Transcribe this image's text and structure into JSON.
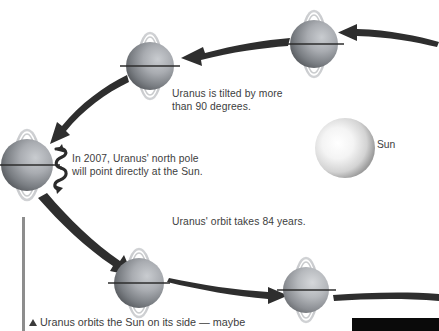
{
  "figure": {
    "title": "Uranus orbits the Sun on its side",
    "background_color": "#ffffff",
    "text_color": "#3d3d3d"
  },
  "captions": {
    "tilt": "Uranus is tilted by more\nthan 90 degrees.",
    "north_pole": "In 2007, Uranus' north pole\nwill point directly at the Sun.",
    "orbit_period": "Uranus' orbit takes 84 years.",
    "bottom": "Uranus orbits the Sun on its side — maybe"
  },
  "labels": {
    "sun": "Sun"
  },
  "bodies": {
    "sun": {
      "name": "Sun",
      "cx": 345,
      "cy": 148,
      "r": 30,
      "color": "#f2f2f2",
      "shade": "#9a9a9a"
    },
    "planets": [
      {
        "name": "uranus-top-right",
        "cx": 314,
        "cy": 44,
        "r": 24,
        "ring_tilt": 0
      },
      {
        "name": "uranus-top-left",
        "cx": 150,
        "cy": 66,
        "r": 24,
        "ring_tilt": 0
      },
      {
        "name": "uranus-left",
        "cx": 27,
        "cy": 165,
        "r": 26,
        "ring_tilt": 0
      },
      {
        "name": "uranus-bottom-left",
        "cx": 139,
        "cy": 283,
        "r": 25,
        "ring_tilt": 0
      },
      {
        "name": "uranus-bottom-right",
        "cx": 306,
        "cy": 290,
        "r": 23,
        "ring_tilt": 0
      }
    ]
  },
  "colors": {
    "planet_light": "#b9bcc0",
    "planet_dark": "#55585c",
    "ring": "#b0b2b6",
    "arrow": "#2e2e2e",
    "rule": "#8d8d8d",
    "black_bar": "#0a0a0a"
  },
  "orbit": {
    "direction": "counter-clockwise",
    "arrow_count": 5,
    "description": "Elliptical orbit path drawn as tapered arrows linking five positions of Uranus around the Sun."
  },
  "rotation_indicator": {
    "attached_to": "uranus-left",
    "description": "coiled spiral arrow showing axial rotation"
  }
}
